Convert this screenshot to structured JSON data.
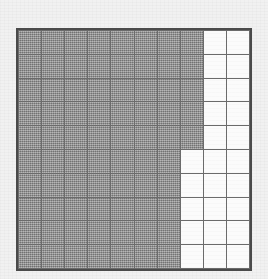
{
  "figure": {
    "type": "fraction-grid",
    "title": "",
    "rows": 10,
    "columns": 10,
    "total_cells": 100,
    "shaded_cells": 75,
    "unshaded_cells": 25,
    "fraction_shaded": "75/100",
    "shaded_per_row": [
      8,
      8,
      8,
      8,
      8,
      7,
      7,
      7,
      7,
      7
    ],
    "colors": {
      "shaded": "#8c8c8c",
      "unshaded": "#fbfbfb",
      "gridline": "#6b6b6b",
      "border": "#4a4a4a",
      "background": "#f1f1f1"
    },
    "cells": [
      [
        "shaded",
        "shaded",
        "shaded",
        "shaded",
        "shaded",
        "shaded",
        "shaded",
        "shaded",
        "blank",
        "blank"
      ],
      [
        "shaded",
        "shaded",
        "shaded",
        "shaded",
        "shaded",
        "shaded",
        "shaded",
        "shaded",
        "blank",
        "blank"
      ],
      [
        "shaded",
        "shaded",
        "shaded",
        "shaded",
        "shaded",
        "shaded",
        "shaded",
        "shaded",
        "blank",
        "blank"
      ],
      [
        "shaded",
        "shaded",
        "shaded",
        "shaded",
        "shaded",
        "shaded",
        "shaded",
        "shaded",
        "blank",
        "blank"
      ],
      [
        "shaded",
        "shaded",
        "shaded",
        "shaded",
        "shaded",
        "shaded",
        "shaded",
        "shaded",
        "blank",
        "blank"
      ],
      [
        "shaded",
        "shaded",
        "shaded",
        "shaded",
        "shaded",
        "shaded",
        "shaded",
        "blank",
        "blank",
        "blank"
      ],
      [
        "shaded",
        "shaded",
        "shaded",
        "shaded",
        "shaded",
        "shaded",
        "shaded",
        "blank",
        "blank",
        "blank"
      ],
      [
        "shaded",
        "shaded",
        "shaded",
        "shaded",
        "shaded",
        "shaded",
        "shaded",
        "blank",
        "blank",
        "blank"
      ],
      [
        "shaded",
        "shaded",
        "shaded",
        "shaded",
        "shaded",
        "shaded",
        "shaded",
        "blank",
        "blank",
        "blank"
      ],
      [
        "shaded",
        "shaded",
        "shaded",
        "shaded",
        "shaded",
        "shaded",
        "shaded",
        "blank",
        "blank",
        "blank"
      ]
    ]
  }
}
